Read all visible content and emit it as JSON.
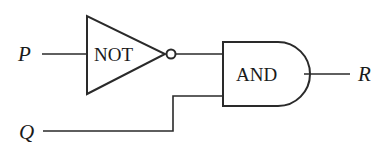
{
  "diagram": {
    "type": "logic-circuit",
    "inputs": [
      {
        "id": "P",
        "label": "P"
      },
      {
        "id": "Q",
        "label": "Q"
      }
    ],
    "gates": [
      {
        "id": "not-gate",
        "label": "NOT",
        "inputs": [
          "P"
        ]
      },
      {
        "id": "and-gate",
        "label": "AND",
        "inputs": [
          "not-gate",
          "Q"
        ]
      }
    ],
    "outputs": [
      {
        "id": "R",
        "label": "R",
        "from": "and-gate"
      }
    ]
  },
  "colors": {
    "stroke": "#2a2a2a",
    "background": "#ffffff"
  }
}
